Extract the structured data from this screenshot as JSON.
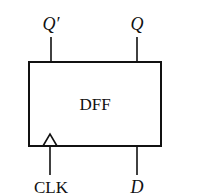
{
  "diagram": {
    "block_label": "DFF",
    "outputs": [
      {
        "label": "Q′",
        "name": "q-bar"
      },
      {
        "label": "Q",
        "name": "q"
      }
    ],
    "inputs": [
      {
        "label": "CLK",
        "name": "clk"
      },
      {
        "label": "D",
        "name": "d"
      }
    ],
    "colors": {
      "stroke": "#111111",
      "background": "#ffffff"
    }
  }
}
